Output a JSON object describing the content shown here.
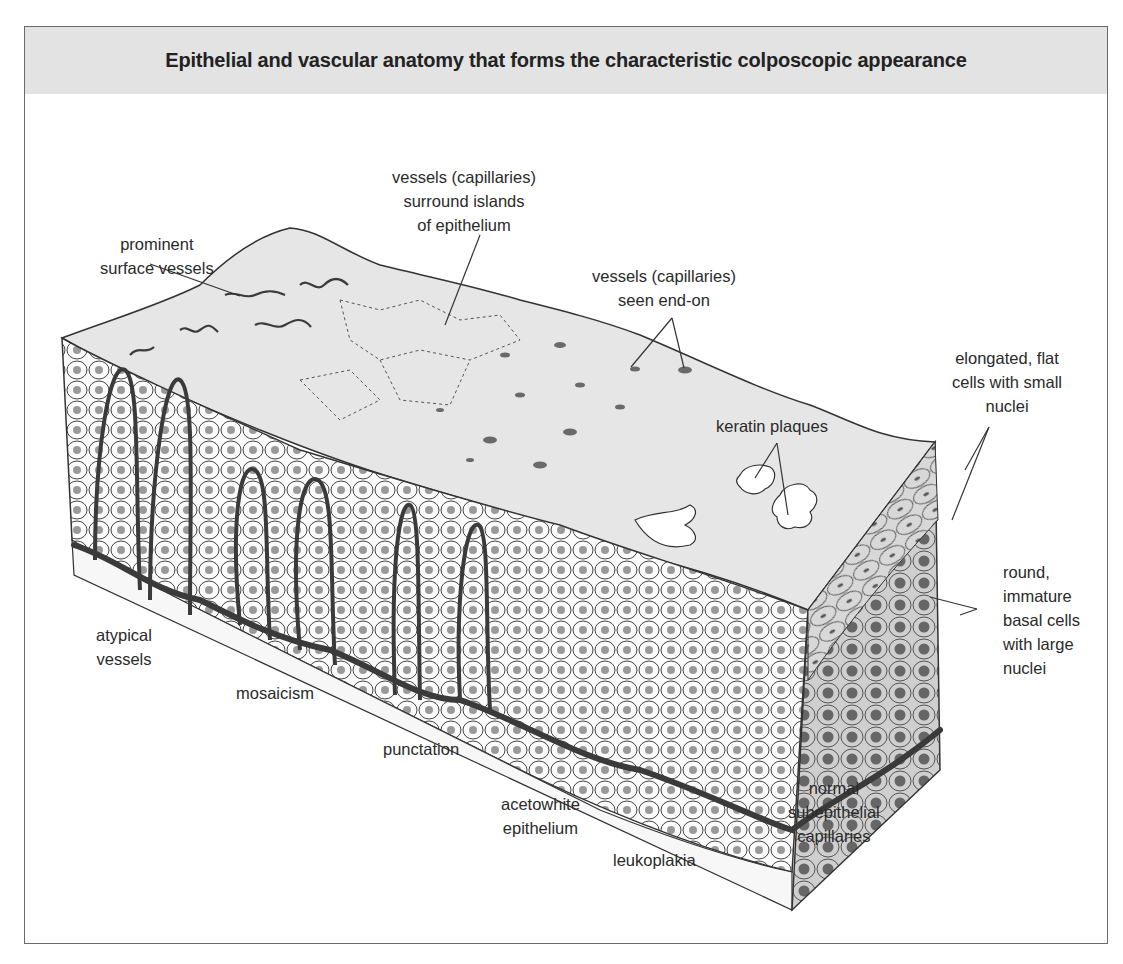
{
  "figure": {
    "title": "Epithelial and vascular anatomy that forms the characteristic colposcopic appearance"
  },
  "labels": {
    "prominent_surface_vessels": "prominent\nsurface vessels",
    "vessels_surround_islands": "vessels (capillaries)\nsurround islands\nof epithelium",
    "vessels_end_on": "vessels (capillaries)\nseen end-on",
    "elongated_flat_cells": "elongated, flat\ncells with small\nnuclei",
    "keratin_plaques": "keratin plaques",
    "round_basal_cells": "round,\nimmature\nbasal cells\nwith large\nnuclei",
    "atypical_vessels": "atypical\nvessels",
    "mosaicism": "mosaicism",
    "punctation": "punctation",
    "acetowhite_epithelium": "acetowhite\nepithelium",
    "leukoplakia": "leukoplakia",
    "normal_capillaries": "normal\nsubepithelial\ncapillaries"
  },
  "colors": {
    "title_bg": "#e3e3e3",
    "surface": "#e6e6e6",
    "side_face": "#d4d4d4",
    "vessel": "#3a3a3a",
    "nucleus": "#9a9a9a",
    "outline": "#333333"
  }
}
